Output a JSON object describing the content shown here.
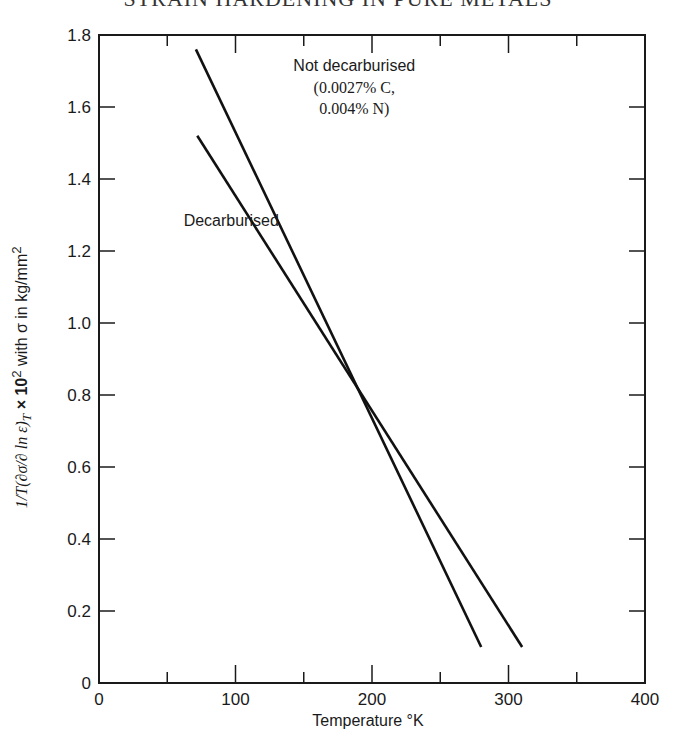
{
  "header": {
    "running_title": "STRAIN HARDENING IN PURE METALS"
  },
  "chart_data": {
    "type": "line",
    "title": "",
    "xlabel": "Temperature °K",
    "ylabel": "(1/T)(∂σ/∂ln ε̇)_T × 10² with σ in kg/mm²",
    "xlim": [
      0,
      400
    ],
    "ylim": [
      0,
      1.8
    ],
    "x_ticks": [
      0,
      100,
      200,
      300,
      400
    ],
    "x_minor_ticks": [
      50,
      150,
      250,
      350
    ],
    "y_ticks": [
      0,
      0.2,
      0.4,
      0.6,
      0.8,
      1.0,
      1.2,
      1.4,
      1.6,
      1.8
    ],
    "grid": false,
    "legend": "inline annotations",
    "series": [
      {
        "name": "Not decarburised (0.0027% C, 0.004% N)",
        "x": [
          71,
          280
        ],
        "y": [
          1.76,
          0.1
        ]
      },
      {
        "name": "Decarburised",
        "x": [
          72,
          310
        ],
        "y": [
          1.52,
          0.1
        ]
      }
    ],
    "annotations": [
      {
        "text": "Not decarburised",
        "x": 187,
        "y": 1.7
      },
      {
        "text": "(0.0027% C,",
        "x": 187,
        "y": 1.64
      },
      {
        "text": "0.004% N)",
        "x": 187,
        "y": 1.58
      },
      {
        "text": "Decarburised",
        "x": 62,
        "y": 1.27
      }
    ]
  },
  "labels": {
    "x_axis": "Temperature °K",
    "y_axis_tail": " × 10",
    "y_axis_sup": "2",
    "y_axis_rest": " with σ in kg/mm",
    "y_axis_sup2": "2",
    "y_frac_num": "1",
    "y_frac_den": "T",
    "y_paren": "(∂σ/∂ ln ε̇)",
    "y_sub": "T",
    "annot_not_decarb_1": "Not decarburised",
    "annot_not_decarb_2": "(0.0027% C,",
    "annot_not_decarb_3": "0.004% N)",
    "annot_decarb": "Decarburised"
  }
}
